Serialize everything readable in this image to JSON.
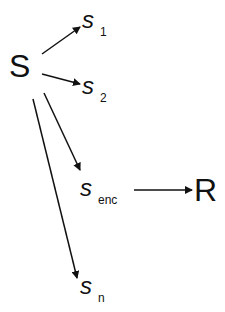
{
  "diagram": {
    "type": "fan-out graph",
    "source_node": {
      "label": "S"
    },
    "nodes": [
      {
        "id": "s1",
        "base": "s",
        "subscript": "1"
      },
      {
        "id": "s2",
        "base": "s",
        "subscript": "2"
      },
      {
        "id": "senc",
        "base": "s",
        "subscript": "enc"
      },
      {
        "id": "sn",
        "base": "s",
        "subscript": "n"
      }
    ],
    "target_node": {
      "label": "R"
    },
    "edges": [
      {
        "from": "S",
        "to": "s1"
      },
      {
        "from": "S",
        "to": "s2"
      },
      {
        "from": "S",
        "to": "senc"
      },
      {
        "from": "S",
        "to": "sn"
      },
      {
        "from": "senc",
        "to": "R"
      }
    ],
    "colors": {
      "stroke": "#111111",
      "background": "#ffffff"
    }
  }
}
